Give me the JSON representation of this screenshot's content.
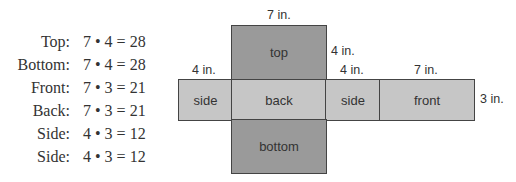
{
  "equations": [
    {
      "label": "Top:",
      "expr": "7 • 4 = 28"
    },
    {
      "label": "Bottom:",
      "expr": "7 • 4 = 28"
    },
    {
      "label": "Front:",
      "expr": "7 • 3 = 21"
    },
    {
      "label": "Back:",
      "expr": "7 • 3 = 21"
    },
    {
      "label": "Side:",
      "expr": "4 • 3 = 12"
    },
    {
      "label": "Side:",
      "expr": "4 • 3 = 12"
    }
  ],
  "net": {
    "faces": {
      "top": "top",
      "back": "back",
      "bottom": "bottom",
      "side_left": "side",
      "side_right": "side",
      "front": "front"
    },
    "dimensions": {
      "top_width": "7 in.",
      "top_height": "4 in.",
      "side_left_width": "4 in.",
      "side_right_width": "4 in.",
      "front_width": "7 in.",
      "front_height": "3 in."
    },
    "colors": {
      "dark_face": "#9a9a9a",
      "light_face": "#c6c6c6",
      "border": "#444444"
    }
  }
}
